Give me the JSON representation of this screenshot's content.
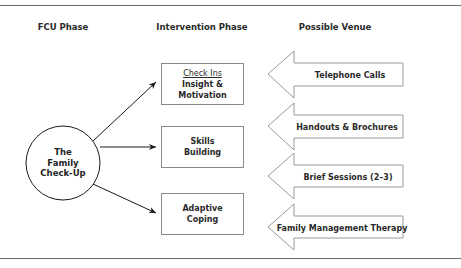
{
  "columns": {
    "fcu_phase": "FCU Phase",
    "intervention_phase": "Intervention Phase",
    "possible_venue": "Possible Venue"
  },
  "fcu": {
    "line1": "The",
    "line2": "Family",
    "line3": "Check-Up"
  },
  "interventions": [
    {
      "title": "Check Ins",
      "subtitle": "Insight & Motivation"
    },
    {
      "title": "Skills",
      "subtitle": "Building"
    },
    {
      "title": "Adaptive",
      "subtitle": "Coping"
    }
  ],
  "venues": [
    "Telephone Calls",
    "Handouts & Brochures",
    "Brief Sessions (2–3)",
    "Family Management Therapy"
  ],
  "colors": {
    "stroke": "#1a1a1a",
    "box_border": "#8a8a8a",
    "arrow_outline": "#9a9a9a",
    "rule": "#6b6b6b"
  }
}
